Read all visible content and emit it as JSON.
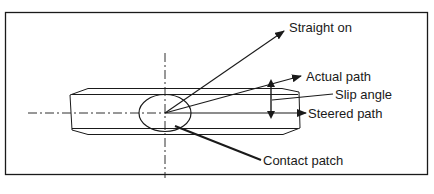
{
  "diagram": {
    "labels": {
      "straight_on": "Straight on",
      "actual_path": "Actual path",
      "slip_angle": "Slip angle",
      "steered_path": "Steered path",
      "contact_patch": "Contact patch"
    },
    "colors": {
      "line": "#1a1a1a",
      "background": "#ffffff"
    }
  }
}
